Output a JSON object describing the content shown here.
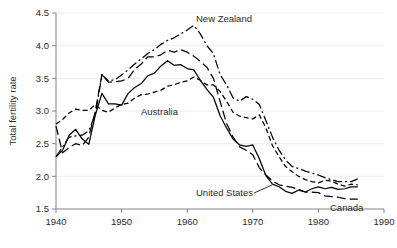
{
  "chart_data": {
    "type": "line",
    "title": "",
    "xlabel": "",
    "ylabel": "Total fertility rate",
    "xlim": [
      1940,
      1990
    ],
    "ylim": [
      1.5,
      4.5
    ],
    "grid": true,
    "legend_position": "inline-annotations",
    "x_ticks": [
      "1940",
      "1950",
      "1960",
      "1970",
      "1980",
      "1990"
    ],
    "y_ticks": [
      "1.5",
      "2.0",
      "2.5",
      "3.0",
      "3.5",
      "4.0",
      "4.5"
    ],
    "x_tick_values": [
      1940,
      1950,
      1960,
      1970,
      1980,
      1990
    ],
    "y_tick_values": [
      1.5,
      2.0,
      2.5,
      3.0,
      3.5,
      4.0,
      4.5
    ],
    "series": [
      {
        "name": "United States",
        "label": "United States",
        "style": "solid",
        "dasharray": "none",
        "color": "#000000",
        "x": [
          1940,
          1941,
          1942,
          1943,
          1944,
          1945,
          1946,
          1947,
          1948,
          1949,
          1950,
          1951,
          1952,
          1953,
          1954,
          1955,
          1956,
          1957,
          1958,
          1959,
          1960,
          1961,
          1962,
          1963,
          1964,
          1965,
          1966,
          1967,
          1968,
          1969,
          1970,
          1971,
          1972,
          1973,
          1974,
          1975,
          1976,
          1977,
          1978,
          1979,
          1980,
          1981,
          1982,
          1983,
          1984,
          1985,
          1986
        ],
        "values": [
          2.3,
          2.4,
          2.63,
          2.72,
          2.57,
          2.49,
          2.94,
          3.27,
          3.11,
          3.11,
          3.09,
          3.27,
          3.36,
          3.42,
          3.54,
          3.58,
          3.69,
          3.77,
          3.7,
          3.71,
          3.65,
          3.63,
          3.47,
          3.33,
          3.21,
          2.93,
          2.74,
          2.57,
          2.48,
          2.46,
          2.48,
          2.27,
          2.01,
          1.88,
          1.84,
          1.77,
          1.74,
          1.79,
          1.76,
          1.81,
          1.84,
          1.81,
          1.83,
          1.8,
          1.81,
          1.84,
          1.84
        ]
      },
      {
        "name": "Canada",
        "label": "Canada",
        "style": "long-dash",
        "dasharray": "9,4",
        "color": "#000000",
        "x": [
          1940,
          1941,
          1942,
          1943,
          1944,
          1945,
          1946,
          1947,
          1948,
          1949,
          1950,
          1951,
          1952,
          1953,
          1954,
          1955,
          1956,
          1957,
          1958,
          1959,
          1960,
          1961,
          1962,
          1963,
          1964,
          1965,
          1966,
          1967,
          1968,
          1969,
          1970,
          1971,
          1972,
          1973,
          1974,
          1975,
          1976,
          1977,
          1978,
          1979,
          1980,
          1981,
          1982,
          1983,
          1984,
          1985,
          1986
        ],
        "values": [
          2.77,
          2.36,
          2.44,
          2.5,
          2.47,
          2.6,
          3.0,
          3.56,
          3.44,
          3.45,
          3.46,
          3.5,
          3.64,
          3.72,
          3.83,
          3.83,
          3.86,
          3.93,
          3.9,
          3.94,
          3.9,
          3.84,
          3.76,
          3.67,
          3.5,
          3.15,
          2.81,
          2.6,
          2.45,
          2.4,
          2.33,
          2.13,
          2.02,
          1.93,
          1.87,
          1.85,
          1.83,
          1.8,
          1.76,
          1.76,
          1.75,
          1.7,
          1.69,
          1.68,
          1.66,
          1.65,
          1.65
        ]
      },
      {
        "name": "New Zealand",
        "label": "New Zealand",
        "style": "dash-dot",
        "dasharray": "9,3,2,3",
        "color": "#000000",
        "x": [
          1940,
          1941,
          1942,
          1943,
          1944,
          1945,
          1946,
          1947,
          1948,
          1949,
          1950,
          1951,
          1952,
          1953,
          1954,
          1955,
          1956,
          1957,
          1958,
          1959,
          1960,
          1961,
          1962,
          1963,
          1964,
          1965,
          1966,
          1967,
          1968,
          1969,
          1970,
          1971,
          1972,
          1973,
          1974,
          1975,
          1976,
          1977,
          1978,
          1979,
          1980,
          1981,
          1982,
          1983,
          1984,
          1985,
          1986
        ],
        "values": [
          2.3,
          2.45,
          2.6,
          2.62,
          2.63,
          2.7,
          2.95,
          3.55,
          3.46,
          3.48,
          3.55,
          3.63,
          3.72,
          3.8,
          3.88,
          3.94,
          4.02,
          4.08,
          4.12,
          4.18,
          4.24,
          4.31,
          4.18,
          4.0,
          3.88,
          3.56,
          3.4,
          3.2,
          3.15,
          3.22,
          3.18,
          3.1,
          2.85,
          2.6,
          2.4,
          2.25,
          2.15,
          2.12,
          2.08,
          2.05,
          2.02,
          1.98,
          1.95,
          1.92,
          1.92,
          1.92,
          1.96
        ]
      },
      {
        "name": "Australia",
        "label": "Australia",
        "style": "short-dash",
        "dasharray": "5,3",
        "color": "#000000",
        "x": [
          1940,
          1941,
          1942,
          1943,
          1944,
          1945,
          1946,
          1947,
          1948,
          1949,
          1950,
          1951,
          1952,
          1953,
          1954,
          1955,
          1956,
          1957,
          1958,
          1959,
          1960,
          1961,
          1962,
          1963,
          1964,
          1965,
          1966,
          1967,
          1968,
          1969,
          1970,
          1971,
          1972,
          1973,
          1974,
          1975,
          1976,
          1977,
          1978,
          1979,
          1980,
          1981,
          1982,
          1983,
          1984,
          1985,
          1986
        ],
        "values": [
          2.8,
          2.87,
          2.97,
          3.03,
          3.01,
          3.01,
          3.1,
          3.01,
          2.98,
          3.05,
          3.1,
          3.12,
          3.2,
          3.25,
          3.26,
          3.29,
          3.32,
          3.38,
          3.4,
          3.44,
          3.46,
          3.52,
          3.47,
          3.4,
          3.4,
          3.3,
          3.15,
          2.98,
          2.92,
          2.9,
          2.88,
          2.94,
          2.74,
          2.47,
          2.3,
          2.15,
          2.07,
          2.0,
          1.95,
          1.92,
          1.9,
          1.94,
          1.93,
          1.88,
          1.85,
          1.88,
          1.87
        ]
      }
    ],
    "annotations": [
      {
        "name": "new-zealand",
        "text": "New Zealand",
        "x_px": 196,
        "y_px": 22,
        "anchor": "start",
        "leader": null
      },
      {
        "name": "australia",
        "text": "Australia",
        "x_px": 141,
        "y_px": 115,
        "anchor": "start",
        "leader": null
      },
      {
        "name": "united-states",
        "text": "United States",
        "x_px": 196,
        "y_px": 196,
        "anchor": "start",
        "leader": {
          "x1": 254,
          "y1": 193,
          "x2": 272,
          "y2": 185
        }
      },
      {
        "name": "canada",
        "text": "Canada",
        "x_px": 330,
        "y_px": 211,
        "anchor": "start",
        "leader": null
      }
    ]
  },
  "axes": {
    "y_title": "Total fertility rate"
  },
  "geometry": {
    "plot_left": 56,
    "plot_right": 384,
    "plot_top": 13,
    "plot_bottom": 209
  }
}
